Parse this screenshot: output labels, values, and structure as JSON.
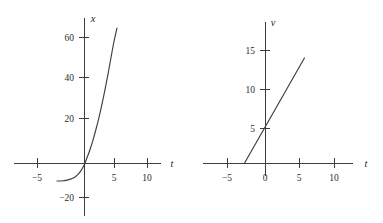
{
  "figure": {
    "background_color": "#ffffff",
    "stroke_color": "#3d3d3d",
    "text_color": "#2b2b2b"
  },
  "chart_data": [
    {
      "type": "line",
      "id": "position-vs-time",
      "title": "",
      "subtitle": "",
      "xlabel": "t",
      "ylabel": "x",
      "grid": false,
      "legend": null,
      "xlim": [
        -7,
        12
      ],
      "ylim": [
        -28,
        68
      ],
      "xticks": [
        -5,
        5,
        10
      ],
      "xticklabels": [
        "−5",
        "5",
        "10"
      ],
      "yticks": [
        60,
        40,
        20,
        -20
      ],
      "yticklabels": [
        "60",
        "40",
        "20",
        "−20"
      ],
      "series": [
        {
          "name": "x(t)",
          "x": [
            -4.5,
            -4.0,
            -3.5,
            -3.0,
            -2.5,
            -2.0,
            -1.5,
            -1.0,
            -0.5,
            0.0,
            0.5,
            1.0,
            1.5,
            2.0,
            2.5,
            3.0,
            3.5,
            4.0,
            4.5,
            5.0,
            5.5
          ],
          "y": [
            -8.0,
            -8.0,
            -7.9,
            -7.7,
            -7.4,
            -6.9,
            -6.2,
            -5.1,
            -3.4,
            -1.0,
            2.3,
            6.0,
            10.2,
            15.0,
            20.3,
            26.2,
            32.6,
            39.5,
            46.9,
            54.0,
            60.0
          ]
        }
      ]
    },
    {
      "type": "line",
      "id": "velocity-vs-time",
      "title": "",
      "subtitle": "",
      "xlabel": "t",
      "ylabel": "v",
      "grid": false,
      "legend": null,
      "xlim": [
        -7,
        12
      ],
      "ylim": [
        -3,
        18
      ],
      "xticks": [
        -5,
        0,
        5,
        10
      ],
      "xticklabels": [
        "−5",
        "0",
        "5",
        "10"
      ],
      "yticks": [
        15,
        10,
        5
      ],
      "yticklabels": [
        "15",
        "10",
        "5"
      ],
      "series": [
        {
          "name": "v(t)",
          "x": [
            -3.0,
            5.8
          ],
          "y": [
            0.0,
            15.0
          ]
        }
      ],
      "annotations": [
        {
          "label": "v-intercept",
          "value": 5
        },
        {
          "label": "t-intercept",
          "value": -3
        }
      ]
    }
  ]
}
